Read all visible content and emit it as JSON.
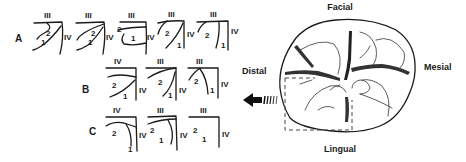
{
  "rows": [
    {
      "label": "A",
      "panels": [
        {
          "top": "III",
          "side": "IV",
          "n2": "2",
          "n1": "1"
        },
        {
          "top": "III",
          "side": "IV",
          "n2": "2",
          "n1": "1"
        },
        {
          "top": "III",
          "side": "IV",
          "n2": "2",
          "n1": "1"
        },
        {
          "top": "III",
          "side": "IV",
          "n2": "2",
          "n1": "1"
        },
        {
          "top": "III",
          "side": "IV",
          "n2": "2",
          "n1": "1"
        }
      ]
    },
    {
      "label": "B",
      "panels": [
        {
          "top": "IV",
          "side": "IV",
          "n2": "2",
          "n1": "1"
        },
        {
          "top": "III",
          "side": "IV",
          "n2": "2",
          "n1": "1"
        },
        {
          "top": "III",
          "side": "IV",
          "n2": "2",
          "n1": "1"
        }
      ]
    },
    {
      "label": "C",
      "panels": [
        {
          "top": "IV",
          "side": "IV",
          "n2": "2",
          "n1": "1"
        },
        {
          "top": "III",
          "side": "IV",
          "n2": "2",
          "n1": "1"
        },
        {
          "top": "III",
          "side": "IV",
          "n2": "2",
          "n1": "1"
        }
      ]
    }
  ],
  "tooth": {
    "facial": "Facial",
    "lingual": "Lingual",
    "distal": "Distal",
    "mesial": "Mesial"
  },
  "arrow": {
    "direction": "left",
    "icon": "arrow-left-icon"
  }
}
